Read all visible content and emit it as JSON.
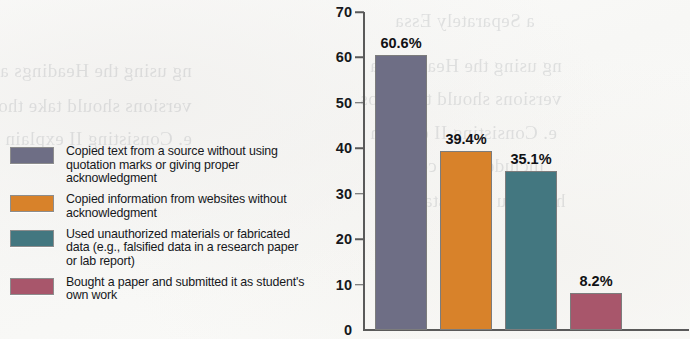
{
  "chart_data": {
    "type": "bar",
    "title": "",
    "subtitle": "",
    "xlabel": "",
    "ylabel": "",
    "ylim": [
      0,
      70
    ],
    "ytick_values": [
      70,
      60,
      50,
      40,
      30,
      20,
      10,
      0
    ],
    "ytick_labels": [
      "70",
      "60",
      "50",
      "40",
      "30",
      "20",
      "10",
      "0"
    ],
    "grid": false,
    "legend_position": "left",
    "categories": [
      "Copied text from a source without using quotation marks or giving proper acknowledgment",
      "Copied information from websites without acknowledgment",
      "Used unauthorized materials or fabricated data (e.g., falsified data in a research paper or lab report)",
      "Bought a paper and submitted it as student's own work"
    ],
    "values": [
      60.6,
      39.4,
      35.1,
      8.2
    ],
    "data_labels": [
      "60.6%",
      "39.4%",
      "35.1%",
      "8.2%"
    ],
    "colors": [
      "#6e6e85",
      "#d8822a",
      "#437780",
      "#a8566b"
    ]
  },
  "legend": {
    "items": [
      {
        "color": "#6e6e85",
        "label": "Copied text from a source without using quotation marks or giving proper acknowledgment",
        "value": "60.6%"
      },
      {
        "color": "#d8822a",
        "label": "Copied information from websites without acknowledgment",
        "value": "39.4%"
      },
      {
        "color": "#437780",
        "label": "Used unauthorized materials or fabricated data (e.g., falsified data in a research paper or lab report)",
        "value": "35.1%"
      },
      {
        "color": "#a8566b",
        "label": "Bought a paper and submitted it as student's own work",
        "value": "8.2%"
      }
    ]
  },
  "page_artifacts": {
    "bleed_through_lines": [
      "a Separately Essa",
      "ng using the Headings a",
      "versions should take thos",
      "e. Consisting II explain",
      "included and content",
      "help you understand ex"
    ]
  }
}
